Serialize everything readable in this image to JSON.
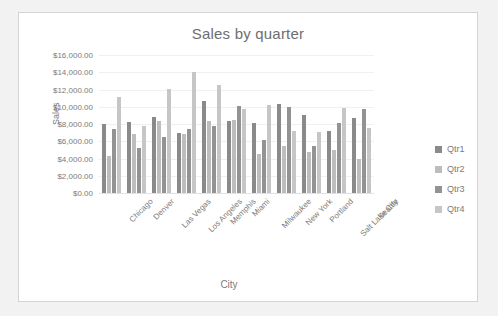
{
  "chart_data": {
    "type": "bar",
    "title": "Sales by quarter",
    "xlabel": "City",
    "ylabel": "Sales",
    "ylim": [
      0,
      16000
    ],
    "ytick_step": 2000,
    "ytick_labels": [
      "$0.00",
      "$2,000.00",
      "$4,000.00",
      "$6,000.00",
      "$8,000.00",
      "$10,000.00",
      "$12,000.00",
      "$14,000.00",
      "$16,000.00"
    ],
    "ytick_values": [
      0,
      2000,
      4000,
      6000,
      8000,
      10000,
      12000,
      14000,
      16000
    ],
    "grid": true,
    "legend_position": "right",
    "categories": [
      "Chicago",
      "Denver",
      "Las Vegas",
      "Los Angeles",
      "Memphis",
      "Miami",
      "Milwaukee",
      "New York",
      "Portland",
      "Salt Lake City",
      "Seattle"
    ],
    "series": [
      {
        "name": "Qtr1",
        "color": "#8a8a8a",
        "values": [
          8000,
          8250,
          8800,
          7000,
          10700,
          8350,
          8150,
          10300,
          9100,
          7150,
          8650
        ]
      },
      {
        "name": "Qtr2",
        "color": "#bdbdbd",
        "values": [
          4250,
          6850,
          8300,
          6800,
          8350,
          8500,
          4550,
          5500,
          4700,
          4950,
          3950
        ]
      },
      {
        "name": "Qtr3",
        "color": "#939393",
        "values": [
          7450,
          5250,
          6550,
          7450,
          7800,
          10050,
          6200,
          9950,
          5450,
          8100,
          9750
        ]
      },
      {
        "name": "Qtr4",
        "color": "#c6c6c6",
        "values": [
          11150,
          7750,
          12100,
          14050,
          12500,
          9750,
          10150,
          7200,
          7050,
          9850,
          7550
        ]
      }
    ]
  },
  "legend": {
    "items": [
      {
        "label": "Qtr1"
      },
      {
        "label": "Qtr2"
      },
      {
        "label": "Qtr3"
      },
      {
        "label": "Qtr4"
      }
    ]
  }
}
